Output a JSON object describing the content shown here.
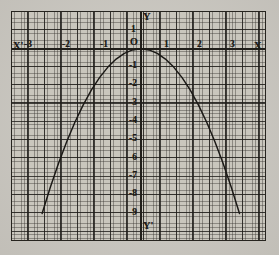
{
  "figure": {
    "kind": "hand-drawn-graph-on-graph-paper",
    "paper_color": "#c9c6bd",
    "ink_color": "#1d1b18",
    "grid_color": "#373430"
  },
  "axis_names": {
    "x_negative": "X'",
    "x_positive": "X",
    "y_positive": "Y",
    "y_negative": "Y'",
    "origin": "O"
  },
  "chart_data": {
    "type": "line",
    "title": "",
    "subtitle": "",
    "xlabel": "X",
    "ylabel": "Y",
    "equation": "y = -x^2",
    "grid": true,
    "legend": "none",
    "xlim": [
      -3.6,
      3.6
    ],
    "ylim": [
      -10.2,
      1.3
    ],
    "xticks": [
      -3,
      -2,
      -1,
      0,
      1,
      2,
      3
    ],
    "xticklabels": [
      "-3",
      "-2",
      "-1",
      "O",
      "1",
      "2",
      "3"
    ],
    "yticks": [
      1,
      0,
      -1,
      -2,
      -3,
      -4,
      -5,
      -6,
      -7,
      -8,
      -9
    ],
    "yticklabels": [
      "1",
      "O",
      "-1",
      "-2",
      "-3",
      "-4",
      "-5",
      "-6",
      "-7",
      "-8",
      "-9"
    ],
    "series": [
      {
        "name": "y = -x^2",
        "x": [
          -3.0,
          -2.75,
          -2.5,
          -2.25,
          -2.0,
          -1.75,
          -1.5,
          -1.25,
          -1.0,
          -0.75,
          -0.5,
          -0.25,
          0.0,
          0.25,
          0.5,
          0.75,
          1.0,
          1.25,
          1.5,
          1.75,
          2.0,
          2.25,
          2.5,
          2.75,
          3.0
        ],
        "values": [
          -9.0,
          -7.5625,
          -6.25,
          -5.0625,
          -4.0,
          -3.0625,
          -2.25,
          -1.5625,
          -1.0,
          -0.5625,
          -0.25,
          -0.0625,
          0.0,
          -0.0625,
          -0.25,
          -0.5625,
          -1.0,
          -1.5625,
          -2.25,
          -3.0625,
          -4.0,
          -5.0625,
          -6.25,
          -7.5625,
          -9.0
        ]
      }
    ],
    "vertex": {
      "x": 0,
      "y": 0
    },
    "annotations": []
  },
  "tick_labels": {
    "x_negative": [
      "-3",
      "-2",
      "-1"
    ],
    "x_positive": [
      "1",
      "2",
      "3"
    ],
    "y_above_origin": [
      "1"
    ],
    "y_below_origin": [
      "-1",
      "-2",
      "-3",
      "-4",
      "-5",
      "-6",
      "-7",
      "-8",
      "-9"
    ]
  }
}
